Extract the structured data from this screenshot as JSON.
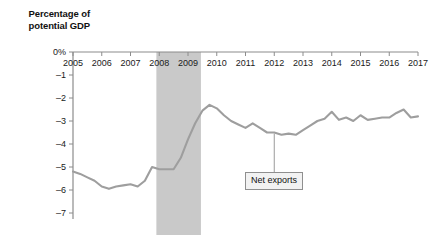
{
  "chart_data": {
    "type": "line",
    "title": "",
    "ylabel": "Percentage of potential GDP",
    "xlabel": "",
    "ylabel_lines": [
      "Percentage of",
      "potential GDP"
    ],
    "ytick_labels": [
      "0%",
      "–1",
      "–2",
      "–3",
      "–4",
      "–5",
      "–6",
      "–7"
    ],
    "ytick_values": [
      0,
      -1,
      -2,
      -3,
      -4,
      -5,
      -6,
      -7
    ],
    "ylim": [
      -7,
      0
    ],
    "xlim": [
      2005,
      2017
    ],
    "xtick_labels": [
      "2005",
      "2006",
      "2007",
      "2008",
      "2009",
      "2010",
      "2011",
      "2012",
      "2013",
      "2014",
      "2015",
      "2016",
      "2017"
    ],
    "xtick_values": [
      2005,
      2006,
      2007,
      2008,
      2009,
      2010,
      2011,
      2012,
      2013,
      2014,
      2015,
      2016,
      2017
    ],
    "grid": false,
    "legend": "none",
    "series": [
      {
        "name": "Net exports",
        "color": "#9e9e9e",
        "x": [
          2005.0,
          2005.25,
          2005.5,
          2005.75,
          2006.0,
          2006.25,
          2006.5,
          2006.75,
          2007.0,
          2007.25,
          2007.5,
          2007.75,
          2008.0,
          2008.25,
          2008.5,
          2008.75,
          2009.0,
          2009.25,
          2009.5,
          2009.75,
          2010.0,
          2010.25,
          2010.5,
          2010.75,
          2011.0,
          2011.25,
          2011.5,
          2011.75,
          2012.0,
          2012.25,
          2012.5,
          2012.75,
          2013.0,
          2013.25,
          2013.5,
          2013.75,
          2014.0,
          2014.25,
          2014.5,
          2014.75,
          2015.0,
          2015.25,
          2015.5,
          2015.75,
          2016.0,
          2016.25,
          2016.5,
          2016.75,
          2017.0
        ],
        "y": [
          -5.2,
          -5.3,
          -5.45,
          -5.6,
          -5.85,
          -5.95,
          -5.85,
          -5.8,
          -5.75,
          -5.85,
          -5.6,
          -5.0,
          -5.1,
          -5.1,
          -5.1,
          -4.6,
          -3.8,
          -3.1,
          -2.55,
          -2.3,
          -2.45,
          -2.75,
          -3.0,
          -3.15,
          -3.3,
          -3.1,
          -3.3,
          -3.5,
          -3.5,
          -3.6,
          -3.55,
          -3.6,
          -3.4,
          -3.2,
          -3.0,
          -2.9,
          -2.6,
          -2.95,
          -2.85,
          -3.0,
          -2.75,
          -2.95,
          -2.9,
          -2.85,
          -2.85,
          -2.65,
          -2.5,
          -2.85,
          -2.8
        ]
      }
    ],
    "shaded_regions": [
      {
        "name": "recession-band",
        "x_start": 2007.9,
        "x_end": 2009.45,
        "color": "#c9c9c9"
      }
    ],
    "annotations": [
      {
        "name": "net-exports-callout",
        "label": "Net exports",
        "x": 2012.0,
        "y": -3.55
      }
    ]
  }
}
